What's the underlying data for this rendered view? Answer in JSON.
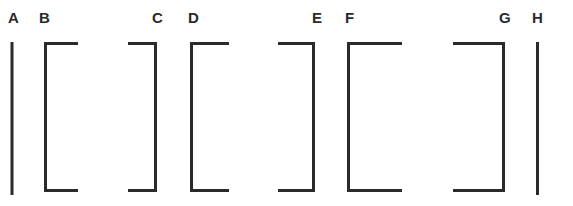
{
  "diagram": {
    "stroke_color": "#2a2a2a",
    "labels": [
      {
        "id": "A",
        "text": "A",
        "x": 8
      },
      {
        "id": "B",
        "text": "B",
        "x": 39
      },
      {
        "id": "C",
        "text": "C",
        "x": 152
      },
      {
        "id": "D",
        "text": "D",
        "x": 188
      },
      {
        "id": "E",
        "text": "E",
        "x": 312
      },
      {
        "id": "F",
        "text": "F",
        "x": 345
      },
      {
        "id": "G",
        "text": "G",
        "x": 499
      },
      {
        "id": "H",
        "text": "H",
        "x": 532
      }
    ],
    "elements": [
      {
        "id": "A",
        "type": "line"
      },
      {
        "id": "B",
        "type": "left-bracket"
      },
      {
        "id": "C",
        "type": "right-bracket"
      },
      {
        "id": "D",
        "type": "left-bracket"
      },
      {
        "id": "E",
        "type": "right-bracket"
      },
      {
        "id": "F",
        "type": "left-bracket"
      },
      {
        "id": "G",
        "type": "right-bracket"
      },
      {
        "id": "H",
        "type": "line"
      }
    ]
  }
}
